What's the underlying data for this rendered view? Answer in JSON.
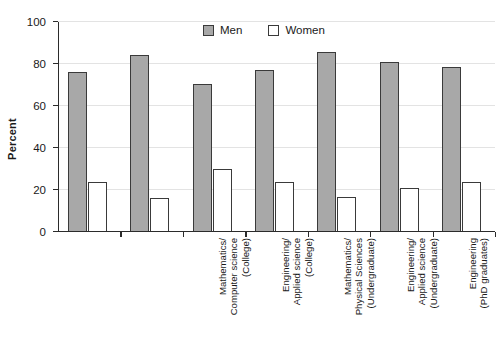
{
  "chart_data": {
    "type": "bar",
    "title": "",
    "subtitle": "",
    "xlabel": "",
    "ylabel": "Percent",
    "ylim": [
      0,
      100
    ],
    "yticks": [
      0,
      20,
      40,
      60,
      80,
      100
    ],
    "ytick_labels": [
      "0",
      "20",
      "40",
      "60",
      "80",
      "100"
    ],
    "grid": true,
    "legend_position": "top-center",
    "categories": [
      "Mathematics/ Computer science (College)",
      "Engineering/ Applied science (College)",
      "Mathematics/ Physical Sciences (Undergraduate)",
      "Engineering/ Applied science (Undergraduate)",
      "Engineering (PhD graduates)",
      "Computer Sciences/ Mathematics (PhD graduates)",
      "Physical Sciences (PhD graduates)"
    ],
    "category_lines": [
      [
        "Mathematics/",
        "Computer science",
        "(College)"
      ],
      [
        "Engineering/",
        "Applied science",
        "(College)"
      ],
      [
        "Mathematics/",
        "Physical Sciences",
        "(Undergraduate)"
      ],
      [
        "Engineering/",
        "Applied science",
        "(Undergraduate)"
      ],
      [
        "Engineering",
        "(PhD graduates)"
      ],
      [
        "Computer Sciences/",
        "Mathematics",
        "(PhD graduates)"
      ],
      [
        "Physical Sciences",
        "(PhD graduates)"
      ]
    ],
    "series": [
      {
        "name": "Men",
        "color": "#a8a8a8",
        "values": [
          76,
          84.5,
          70.5,
          77,
          85.5,
          81,
          78.5
        ]
      },
      {
        "name": "Women",
        "color": "#ffffff",
        "values": [
          24,
          16,
          30,
          24,
          16.5,
          21,
          24
        ]
      }
    ]
  },
  "legend": {
    "items": [
      {
        "label": "Men",
        "swatch": "filled-gray-swatch"
      },
      {
        "label": "Women",
        "swatch": "empty-white-swatch"
      }
    ]
  },
  "axis": {
    "y_title": "Percent"
  }
}
